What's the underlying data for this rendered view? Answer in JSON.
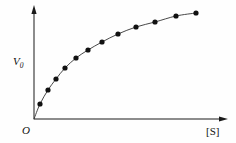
{
  "figure": {
    "kind": "scatter-with-fitted-curve",
    "background_color": "#fefefe",
    "ink_color": "#1a1a1a"
  },
  "labels": {
    "y_axis_symbol": "V",
    "y_axis_subscript": "0",
    "y_axis_full": "V0",
    "x_axis": "[S]",
    "origin": "O"
  },
  "chart_data": {
    "type": "scatter",
    "title": "",
    "subtitle": "",
    "xlabel": "[S]",
    "ylabel": "V0",
    "grid": false,
    "legend": null,
    "annotations": [
      {
        "text": "O",
        "role": "origin-marker",
        "x": 0,
        "y": 0
      }
    ],
    "xlim": [
      0,
      110
    ],
    "ylim": [
      0,
      110
    ],
    "axis_ticks": {
      "x": [],
      "y": []
    },
    "axis_arrowheads": {
      "x": true,
      "y": true
    },
    "curve_model": "hyperbolic saturation (Michaelis-Menten)",
    "series": [
      {
        "name": "initial velocity vs substrate concentration",
        "marker": "filled-circle",
        "marker_color": "#111111",
        "line_color": "#333333",
        "x": [
          3,
          7,
          12,
          18,
          25,
          33,
          42,
          52,
          63,
          75,
          88,
          100
        ],
        "y": [
          14,
          27,
          38,
          49,
          59,
          68,
          76,
          83,
          89,
          93,
          97,
          99
        ]
      }
    ],
    "pixel_geometry": {
      "note": "plot-space anchors used by the renderer",
      "origin_px": {
        "x": 34,
        "y": 119
      },
      "x_axis_end_px": {
        "x": 222,
        "y": 119
      },
      "y_axis_end_px": {
        "x": 34,
        "y": 11
      },
      "data_points_px": [
        {
          "x": 40,
          "y": 104
        },
        {
          "x": 48,
          "y": 90
        },
        {
          "x": 56,
          "y": 79
        },
        {
          "x": 65,
          "y": 68
        },
        {
          "x": 76,
          "y": 58
        },
        {
          "x": 88,
          "y": 50
        },
        {
          "x": 102,
          "y": 42
        },
        {
          "x": 118,
          "y": 34
        },
        {
          "x": 136,
          "y": 27
        },
        {
          "x": 155,
          "y": 22
        },
        {
          "x": 176,
          "y": 16
        },
        {
          "x": 196,
          "y": 13
        }
      ],
      "marker_radius_px": 2.6
    }
  }
}
